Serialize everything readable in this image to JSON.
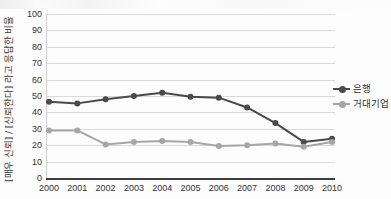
{
  "chart_data": {
    "type": "line",
    "title": "",
    "xlabel": "",
    "ylabel": "[매우 신뢰] / [신뢰한다] 라고 응답한 비율",
    "categories": [
      "2000",
      "2001",
      "2002",
      "2003",
      "2004",
      "2005",
      "2006",
      "2007",
      "2008",
      "2009",
      "2010"
    ],
    "ylim": [
      0,
      100
    ],
    "yticks": [
      "0",
      "10",
      "20",
      "30",
      "40",
      "50",
      "60",
      "70",
      "80",
      "90",
      "100"
    ],
    "grid": true,
    "legend_position": "right",
    "series": [
      {
        "name": "은행",
        "color": "#4a4a4a",
        "marker": "circle",
        "values": [
          46.5,
          45.5,
          48,
          50,
          52,
          49.5,
          49,
          43,
          33.5,
          22,
          24
        ]
      },
      {
        "name": "거대기업",
        "color": "#a6a6a6",
        "marker": "circle",
        "values": [
          29,
          29,
          20.5,
          22,
          22.5,
          22,
          19.5,
          20,
          21,
          19,
          22
        ]
      }
    ]
  },
  "legend": {
    "items": [
      {
        "label": "은행",
        "color": "#4a4a4a"
      },
      {
        "label": "거대기업",
        "color": "#a6a6a6"
      }
    ]
  },
  "colors": {
    "bank": "#4a4a4a",
    "corporation": "#a6a6a6",
    "grid": "#d4d4d6",
    "axis": "#3d3d3d",
    "text": "#2f2f2f",
    "background": "#fdfdfd"
  }
}
